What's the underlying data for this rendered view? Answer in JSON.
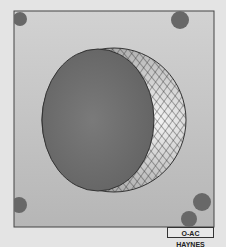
{
  "figure": {
    "credit_label": "O-AC HAYNES",
    "colors": {
      "background": "#e4e4e4",
      "panel_top": "#d0d0d0",
      "panel_bottom": "#b8b8b8",
      "frame": "#444444",
      "disc": "#707070",
      "corner_dots": "#6a6a6a",
      "hatch": "#333333",
      "crescent_fill": "#d8d8d8"
    },
    "elements": [
      {
        "name": "panel",
        "description": "square panel with frame"
      },
      {
        "name": "outer-sphere",
        "description": "circle outline"
      },
      {
        "name": "inner-disc",
        "description": "dark filled disc offset left"
      },
      {
        "name": "crescent",
        "description": "cross-hatched crescent on right side"
      },
      {
        "name": "corner-dots",
        "count": 5
      }
    ]
  }
}
